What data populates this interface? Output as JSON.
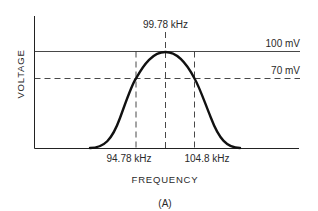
{
  "figure": {
    "caption": "(A)",
    "x_axis_label": "FREQUENCY",
    "y_axis_label": "VOLTAGE",
    "center_frequency_label": "99.78 kHz",
    "lower_frequency_label": "94.78 kHz",
    "upper_frequency_label": "104.8 kHz",
    "peak_voltage_label": "100 mV",
    "half_power_voltage_label": "70 mV"
  },
  "colors": {
    "line": "#111111",
    "text": "#2a2a2a",
    "background": "#ffffff"
  }
}
